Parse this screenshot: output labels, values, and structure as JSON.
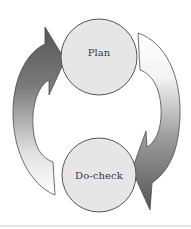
{
  "diagram": {
    "type": "cycle",
    "nodes": [
      {
        "id": "plan",
        "label": "Plan",
        "cx": 99,
        "cy": 57,
        "r": 38
      },
      {
        "id": "do_check",
        "label": "Do-check",
        "cx": 99,
        "cy": 175,
        "r": 37
      }
    ],
    "edges": [
      {
        "from": "do_check",
        "to": "plan",
        "side": "left",
        "direction": "upward"
      },
      {
        "from": "plan",
        "to": "do_check",
        "side": "right",
        "direction": "downward"
      }
    ],
    "colors": {
      "node_fill": "#e6e6e6",
      "node_stroke": "#555555",
      "arrow_dark": "#5e5e5e",
      "arrow_light": "#ffffff",
      "arrow_stroke": "#4a4a4a",
      "label_text": "#3a3a3a"
    }
  }
}
